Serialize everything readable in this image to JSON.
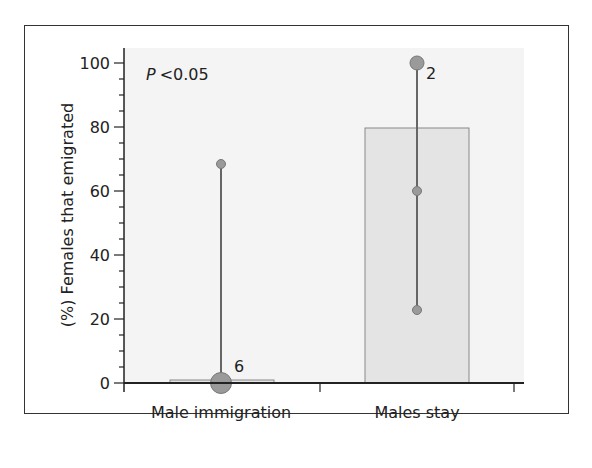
{
  "chart_data": {
    "type": "bar",
    "title": "",
    "xlabel": "",
    "ylabel": "(%) Females that emigrated",
    "ylim": [
      0,
      100
    ],
    "yticks": [
      0,
      20,
      40,
      60,
      80,
      100
    ],
    "ytick_labels": [
      "0",
      "20",
      "40",
      "60",
      "80",
      "100"
    ],
    "minor_tick_step": 5,
    "grid": false,
    "categories": [
      "Male immigration",
      "Males stay"
    ],
    "values": [
      1,
      80
    ],
    "annotation": {
      "p_prefix": "P",
      "p_text": "<0.05"
    },
    "ranges": [
      {
        "category": "Male immigration",
        "min": 0,
        "max": 68,
        "n_label": "6",
        "points": [
          0,
          68
        ]
      },
      {
        "category": "Males stay",
        "min": 22.5,
        "max": 100,
        "n_label": "2",
        "points": [
          22.5,
          60,
          100
        ]
      }
    ],
    "colors": {
      "plot_bg": "#f4f4f4",
      "bar_fill": "#e4e4e4",
      "bar_stroke": "#888888",
      "range_line": "#666666",
      "point_fill": "#9a9a9a",
      "axis": "#222222",
      "frame": "#333333"
    }
  }
}
